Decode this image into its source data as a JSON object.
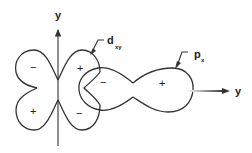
{
  "figure": {
    "vertical_axis": {
      "label": "y"
    },
    "horizontal_axis": {
      "label": "y"
    },
    "orbitals": [
      {
        "name": "d_xy",
        "label_main": "d",
        "label_sub": "xy",
        "lobes": [
          {
            "position": "upper-left",
            "sign": "−"
          },
          {
            "position": "lower-left",
            "sign": "+"
          },
          {
            "position": "upper-right",
            "sign": "+"
          },
          {
            "position": "lower-right",
            "sign": "−"
          }
        ]
      },
      {
        "name": "p_x",
        "label_main": "p",
        "label_sub": "x",
        "lobes": [
          {
            "position": "left",
            "sign": "−"
          },
          {
            "position": "right",
            "sign": "+"
          }
        ]
      }
    ],
    "colors": {
      "line": "#333333",
      "background": "#ffffff"
    }
  }
}
